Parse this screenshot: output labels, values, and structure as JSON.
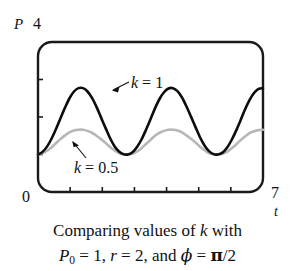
{
  "figure": {
    "background": "#ffffff"
  },
  "axes": {
    "y_symbol": "P",
    "y_max_label": "4",
    "y_min_label": "0",
    "x_symbol": "t",
    "x_max_label": "7",
    "x_min": 0,
    "x_max": 7,
    "y_min": 0,
    "y_max": 4,
    "x_ticks": [
      1,
      2,
      3,
      4,
      5,
      6
    ],
    "y_ticks": [
      1,
      2,
      3
    ],
    "frame_color": "#1a1a1a",
    "frame_corner_radius": 14
  },
  "curve_labels": {
    "black": {
      "var": "k",
      "eq": " = 1"
    },
    "gray": {
      "var": "k",
      "eq": " = 0.5"
    }
  },
  "caption": {
    "line1_a": "Comparing values of ",
    "line1_var": "k",
    "line1_b": " with",
    "line2_P": "P",
    "line2_sub": "0",
    "line2_a": " = 1, ",
    "line2_r": "r",
    "line2_b": " = 2, and ",
    "line2_phi": "ϕ",
    "line2_c": " = ",
    "line2_pi": "π",
    "line2_d": "/2"
  },
  "chart_data": {
    "type": "line",
    "title": "",
    "xlabel": "t",
    "ylabel": "P",
    "xlim": [
      0,
      7
    ],
    "ylim": [
      0,
      4
    ],
    "grid": false,
    "legend": "inline-annotations",
    "x_tick_labels": [
      "0",
      "7"
    ],
    "y_tick_labels": [
      "0",
      "4"
    ],
    "series": [
      {
        "name": "k = 1",
        "color": "#0d0d0d",
        "width": 2.6,
        "x": [
          0.0,
          0.14,
          0.28,
          0.42,
          0.56,
          0.7,
          0.84,
          0.98,
          1.12,
          1.26,
          1.4,
          1.54,
          1.68,
          1.82,
          1.96,
          2.1,
          2.24,
          2.38,
          2.52,
          2.66,
          2.8,
          2.94,
          3.08,
          3.22,
          3.36,
          3.5,
          3.64,
          3.78,
          3.92,
          4.06,
          4.2,
          4.34,
          4.48,
          4.62,
          4.76,
          4.9,
          5.04,
          5.18,
          5.32,
          5.46,
          5.6,
          5.74,
          5.88,
          6.02,
          6.16,
          6.3,
          6.44,
          6.58,
          6.72,
          6.86,
          7.0
        ],
        "y": [
          1.0,
          1.07,
          1.21,
          1.42,
          1.68,
          1.97,
          2.25,
          2.5,
          2.68,
          2.77,
          2.77,
          2.68,
          2.51,
          2.27,
          1.99,
          1.71,
          1.44,
          1.22,
          1.08,
          1.01,
          1.0,
          1.06,
          1.2,
          1.4,
          1.66,
          1.94,
          2.23,
          2.48,
          2.66,
          2.76,
          2.77,
          2.69,
          2.52,
          2.28,
          2.01,
          1.73,
          1.46,
          1.24,
          1.09,
          1.01,
          1.0,
          1.05,
          1.18,
          1.38,
          1.63,
          1.91,
          2.2,
          2.45,
          2.64,
          2.75,
          2.77
        ]
      },
      {
        "name": "k = 0.5",
        "color": "#b7b7b7",
        "width": 2.6,
        "x": [
          0.0,
          0.14,
          0.28,
          0.42,
          0.56,
          0.7,
          0.84,
          0.98,
          1.12,
          1.26,
          1.4,
          1.54,
          1.68,
          1.82,
          1.96,
          2.1,
          2.24,
          2.38,
          2.52,
          2.66,
          2.8,
          2.94,
          3.08,
          3.22,
          3.36,
          3.5,
          3.64,
          3.78,
          3.92,
          4.06,
          4.2,
          4.34,
          4.48,
          4.62,
          4.76,
          4.9,
          5.04,
          5.18,
          5.32,
          5.46,
          5.6,
          5.74,
          5.88,
          6.02,
          6.16,
          6.3,
          6.44,
          6.58,
          6.72,
          6.86,
          7.0
        ],
        "y": [
          1.0,
          1.03,
          1.1,
          1.19,
          1.3,
          1.41,
          1.51,
          1.59,
          1.64,
          1.66,
          1.66,
          1.63,
          1.58,
          1.5,
          1.41,
          1.31,
          1.2,
          1.11,
          1.04,
          1.0,
          1.0,
          1.02,
          1.08,
          1.17,
          1.28,
          1.39,
          1.5,
          1.58,
          1.63,
          1.66,
          1.66,
          1.64,
          1.59,
          1.51,
          1.42,
          1.32,
          1.21,
          1.12,
          1.04,
          1.01,
          1.0,
          1.02,
          1.07,
          1.16,
          1.26,
          1.38,
          1.48,
          1.57,
          1.62,
          1.65,
          1.66
        ]
      }
    ],
    "annotations": [
      {
        "text": "k = 1",
        "points_to_series": "k = 1",
        "x": 1.9,
        "y": 3.05
      },
      {
        "text": "k = 0.5",
        "points_to_series": "k = 0.5",
        "x": 1.0,
        "y": 0.55
      }
    ]
  }
}
